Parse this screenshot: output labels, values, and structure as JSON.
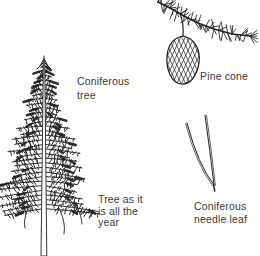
{
  "figure_title": "Coniferous tree illustration",
  "labels": {
    "coniferous_tree": {
      "lines": [
        "Coniferous",
        "tree"
      ]
    },
    "pine_cone": {
      "lines": [
        "Pine cone"
      ]
    },
    "season_note": {
      "lines": [
        "Tree as it",
        "is all the",
        "year"
      ]
    },
    "needle_leaf": {
      "lines": [
        "Coniferous",
        "needle leaf"
      ]
    }
  },
  "illustrations": {
    "tree": "coniferous tree pen-and-ink drawing",
    "cone": "pine cone hanging from needled branch",
    "needles": "pair of coniferous needle leaves"
  },
  "colors": {
    "ink": "#1f1f1f",
    "text": "#3a3a3a",
    "background": "#ffffff"
  }
}
